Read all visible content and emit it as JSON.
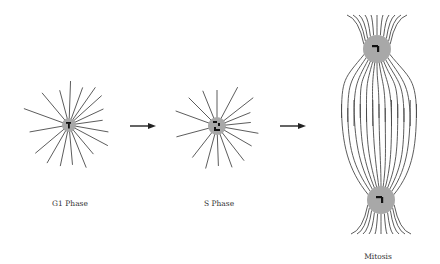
{
  "diagram": {
    "type": "cell-cycle-centrosome-microtubules",
    "stages": [
      {
        "id": "g1",
        "label": "G1 Phase",
        "centrosome": {
          "cx": 69,
          "cy": 125,
          "r": 7
        },
        "aster_rays": 18,
        "ray_length": [
          28,
          48
        ]
      },
      {
        "id": "s",
        "label": "S Phase",
        "centrosome": {
          "cx": 217,
          "cy": 126,
          "r": 9
        },
        "aster_rays": 16,
        "ray_length": [
          28,
          48
        ]
      },
      {
        "id": "mitosis",
        "label": "Mitosis",
        "spindle_poles": [
          {
            "cx": 377,
            "cy": 49,
            "r": 14
          },
          {
            "cx": 381,
            "cy": 200,
            "r": 14
          }
        ]
      }
    ],
    "arrows": [
      {
        "from": "g1",
        "to": "s",
        "x1": 130,
        "x2": 156,
        "y": 126
      },
      {
        "from": "s",
        "to": "mitosis",
        "x1": 280,
        "x2": 306,
        "y": 126
      }
    ],
    "colors": {
      "microtubule": "#4a4a4a",
      "centrosome_fill": "#a8a8a8",
      "centriole": "#111111",
      "arrow": "#222222",
      "label": "#333333"
    }
  },
  "labels": {
    "g1": "G1 Phase",
    "s": "S Phase",
    "mitosis": "Mitosis"
  }
}
